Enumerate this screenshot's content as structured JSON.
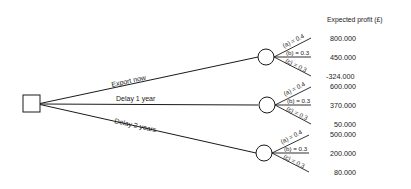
{
  "header": {
    "title": "Expected profit (£)"
  },
  "decision_node": {
    "shape": "square"
  },
  "branches": [
    {
      "label": "Export now",
      "outcomes": [
        {
          "event": "(a)",
          "prob": "0.4",
          "label": "(a) = 0.4",
          "value": "800.000"
        },
        {
          "event": "(b)",
          "prob": "0.3",
          "label": "(b) = 0.3",
          "value": "450.000"
        },
        {
          "event": "(c)",
          "prob": "0.3",
          "label": "(c) = 0.3",
          "value": "-324.000"
        }
      ]
    },
    {
      "label": "Delay 1 year",
      "outcomes": [
        {
          "event": "(a)",
          "prob": "0.4",
          "label": "(a) = 0.4",
          "value": "600.000"
        },
        {
          "event": "(b)",
          "prob": "0.3",
          "label": "(b) = 0.3",
          "value": "370.000"
        },
        {
          "event": "(c)",
          "prob": "0.3",
          "label": "(c) = 0.3",
          "value": "50.000"
        }
      ]
    },
    {
      "label": "Delay 2 years",
      "outcomes": [
        {
          "event": "(a)",
          "prob": "0.4",
          "label": "(a) = 0.4",
          "value": "500.000"
        },
        {
          "event": "(b)",
          "prob": "0.3",
          "label": "(b) = 0.3",
          "value": "200.000"
        },
        {
          "event": "(c)",
          "prob": "0.3",
          "label": "(c) = 0.3",
          "value": "80.000"
        }
      ]
    }
  ]
}
